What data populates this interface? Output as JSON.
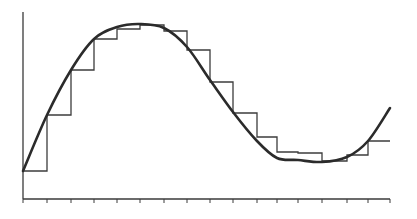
{
  "chart_data": {
    "type": "line",
    "title": "",
    "xlabel": "",
    "ylabel": "",
    "grid": false,
    "legend": null,
    "x_ticks_count": 17,
    "xlim": [
      0,
      16
    ],
    "ylim": [
      0,
      100
    ],
    "series": [
      {
        "name": "curve",
        "style": "smooth",
        "x": [
          0,
          1,
          2,
          3,
          4,
          5,
          6,
          7,
          8,
          9,
          10,
          11,
          12,
          13,
          14,
          15,
          16
        ],
        "values": [
          15,
          45,
          69,
          86,
          91,
          93,
          90,
          80,
          62,
          45,
          29,
          20,
          16,
          14,
          17,
          25,
          49
        ]
      },
      {
        "name": "step_approximation",
        "style": "step-post",
        "x": [
          0,
          1,
          2,
          3,
          4,
          5,
          6,
          7,
          8,
          9,
          10,
          11,
          12,
          13,
          14,
          15
        ],
        "values": [
          15,
          45,
          69,
          86,
          92,
          93,
          90,
          80,
          63,
          46,
          33,
          25,
          24,
          20,
          23,
          31
        ]
      }
    ],
    "pixel_geometry": {
      "x0": 23,
      "x1": 390,
      "y_baseline": 199,
      "y_axis_top": 12,
      "tick_x": [
        23,
        47,
        71,
        94,
        117,
        140,
        164,
        187,
        210,
        233,
        257,
        277,
        298,
        322,
        347,
        368,
        390
      ],
      "step_y": [
        171,
        115,
        70,
        39,
        29,
        25,
        31,
        50,
        82,
        113,
        137,
        152,
        153,
        161,
        155,
        141
      ],
      "curve_points": [
        [
          23,
          171
        ],
        [
          47,
          115
        ],
        [
          71,
          70
        ],
        [
          94,
          39
        ],
        [
          117,
          27
        ],
        [
          140,
          24
        ],
        [
          164,
          28
        ],
        [
          187,
          47
        ],
        [
          210,
          80
        ],
        [
          233,
          112
        ],
        [
          257,
          141
        ],
        [
          277,
          158
        ],
        [
          298,
          160
        ],
        [
          322,
          162
        ],
        [
          347,
          157
        ],
        [
          368,
          141
        ],
        [
          390,
          108
        ]
      ]
    }
  }
}
